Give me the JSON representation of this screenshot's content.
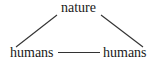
{
  "diagram": {
    "nodes": [
      {
        "id": "top",
        "label": "nature"
      },
      {
        "id": "left",
        "label": "humans"
      },
      {
        "id": "right",
        "label": "humans"
      }
    ],
    "edges": [
      {
        "from": "top",
        "to": "left"
      },
      {
        "from": "top",
        "to": "right"
      },
      {
        "from": "left",
        "to": "right"
      }
    ],
    "colors": {
      "line": "#333333",
      "text": "#1a1a1a",
      "background": "#ffffff"
    }
  }
}
